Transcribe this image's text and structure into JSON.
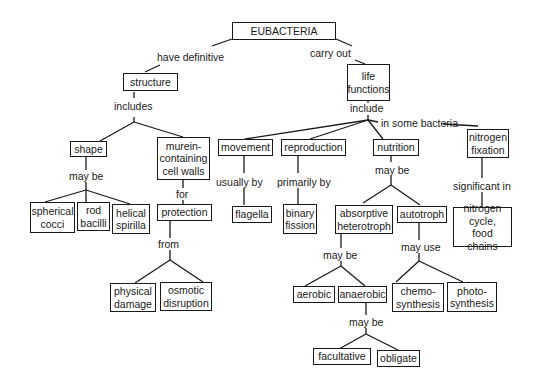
{
  "nodes": {
    "eubacteria": "EUBACTERIA",
    "structure": "structure",
    "life_functions": "life\nfunctions",
    "shape": "shape",
    "murein": "murein-\ncontaining\ncell walls",
    "movement": "movement",
    "reproduction": "reproduction",
    "nutrition": "nutrition",
    "nitrogen_fixation": "nitrogen\nfixation",
    "spherical": "spherical\ncocci",
    "rod": "rod\nbacilli",
    "helical": "helical\nspirilla",
    "protection": "protection",
    "flagella": "flagella",
    "binary": "binary\nfission",
    "absorptive": "absorptive\nheterotroph",
    "autotroph": "autotroph",
    "nitrogen_cycle": "nitrogen\ncycle,\nfood chains",
    "physical": "physical\ndamage",
    "osmotic": "osmotic\ndisruption",
    "aerobic": "aerobic",
    "anaerobic": "anaerobic",
    "chemo": "chemo-\nsynthesis",
    "photo": "photo-\nsynthesis",
    "facultative": "facultative",
    "obligate": "obligate"
  },
  "links": {
    "have_definitive": "have  definitive",
    "carry_out": "carry  out",
    "includes": "includes",
    "include": "include",
    "in_some_bacteria": "in  some  bacteria",
    "may_be_shape": "may  be",
    "for": "for",
    "usually_by": "usually  by",
    "primarily_by": "primarily   by",
    "may_be_nutrition": "may  be",
    "significant_in": "significant  in",
    "from": "from",
    "may_be_hetero": "may  be",
    "may_use": "may  use",
    "may_be_anaerobic": "may  be"
  }
}
